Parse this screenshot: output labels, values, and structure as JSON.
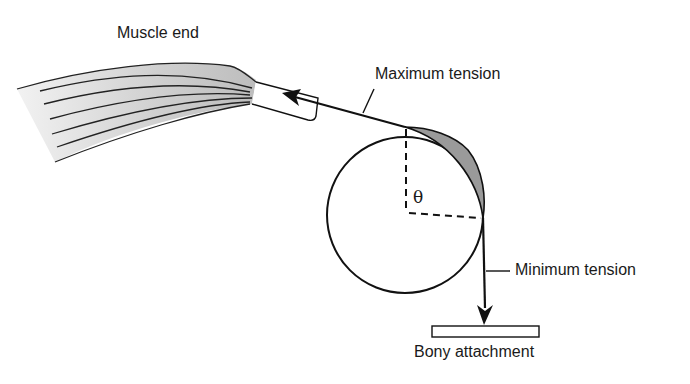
{
  "diagram": {
    "labels": {
      "muscle_end": "Muscle end",
      "max_tension": "Maximum tension",
      "min_tension": "Minimum tension",
      "bony_attachment": "Bony attachment",
      "angle": "θ"
    },
    "colors": {
      "stroke": "#111111",
      "shaded_region": "#9a9a9a",
      "muscle_fill": "#d4d4d4"
    },
    "geometry": {
      "pulley_center": [
        405,
        215
      ],
      "pulley_radius": 78
    }
  }
}
